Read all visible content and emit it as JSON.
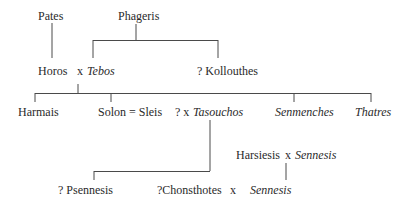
{
  "diagram": {
    "type": "family-tree",
    "generation_1": {
      "pates": "Pates",
      "phageris": "Phageris"
    },
    "generation_2": {
      "horos": "Horos",
      "marriage_x": "x",
      "tebos": "Tebos",
      "kollouthes": "? Kollouthes"
    },
    "generation_3": {
      "harmais": "Harmais",
      "solon": "Solon = Sleis",
      "uncertain_marriage": "? x",
      "tasouchos": "Tasouchos",
      "senmenches": "Senmenches",
      "thatres": "Thatres"
    },
    "generation_4": {
      "harsiesis": "Harsiesis",
      "marriage_x": "x",
      "sennesis_wife": "Sennesis",
      "psennesis": "? Psennesis",
      "chonsthotes": "?Chonsthotes",
      "marriage_x2": "x",
      "sennesis": "Sennesis"
    }
  }
}
